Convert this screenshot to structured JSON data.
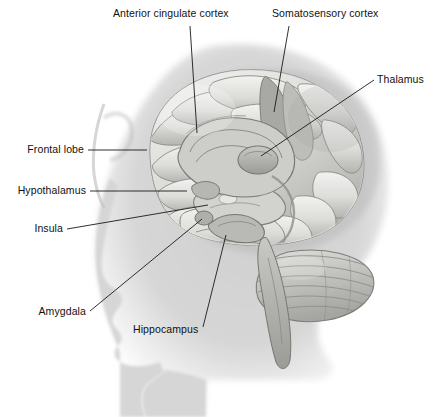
{
  "figure": {
    "name": "brain-anatomy-diagram",
    "view": "lateral (side) view, facing left",
    "style": "grayscale medical illustration",
    "colors": {
      "background": "#ffffff",
      "silhouette": "#d6d6d6",
      "silhouette_shadow": "#c4c4c4",
      "brain_light": "#ebebe8",
      "brain_mid": "#c9c9c6",
      "brain_dark": "#9a9a98",
      "outline": "#6f6f6d",
      "leader_line": "#1a1a1a",
      "label_text": "#111111"
    }
  },
  "labels": [
    {
      "id": "anterior-cingulate-cortex",
      "text": "Anterior cingulate cortex",
      "align": "left",
      "x": 113,
      "y": 8,
      "leader": "M 190 26 L 197 133"
    },
    {
      "id": "somatosensory-cortex",
      "text": "Somatosensory cortex",
      "align": "left",
      "x": 272,
      "y": 8,
      "leader": "M 289 26 L 274 112"
    },
    {
      "id": "thalamus",
      "text": "Thalamus",
      "align": "left",
      "x": 377,
      "y": 74,
      "leader": "M 374 80 L 261 156"
    },
    {
      "id": "frontal-lobe",
      "text": "Frontal lobe",
      "align": "right",
      "x": 10,
      "y": 144,
      "leader": "M 88 150 L 147 150"
    },
    {
      "id": "hypothalamus",
      "text": "Hypothalamus",
      "align": "right",
      "x": 10,
      "y": 185,
      "leader": "M 90 191 L 187 191"
    },
    {
      "id": "insula",
      "text": "Insula",
      "align": "right",
      "x": 10,
      "y": 223,
      "leader": "M 67 229 L 208 205"
    },
    {
      "id": "amygdala",
      "text": "Amygdala",
      "align": "right",
      "x": 10,
      "y": 308,
      "leader": "M 90 311 L 202 219"
    },
    {
      "id": "hippocampus",
      "text": "Hippocampus",
      "align": "left",
      "x": 133,
      "y": 325,
      "leader": "M 203 327 L 226 235"
    }
  ],
  "structures": [
    "cerebral cortex",
    "frontal lobe",
    "anterior cingulate cortex",
    "somatosensory cortex",
    "thalamus",
    "hypothalamus",
    "insula",
    "amygdala",
    "hippocampus",
    "cerebellum",
    "brainstem"
  ]
}
